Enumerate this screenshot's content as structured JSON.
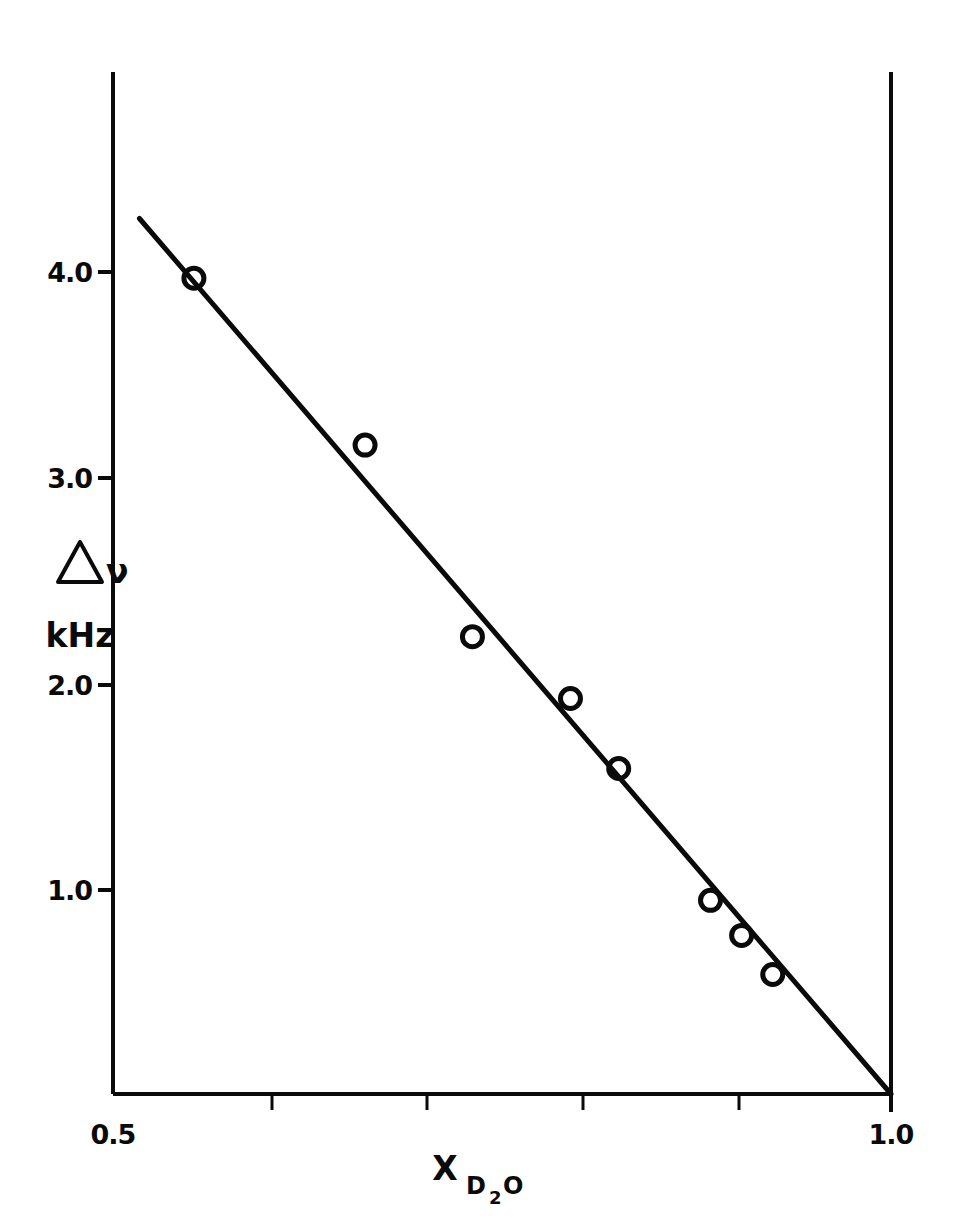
{
  "chart_data": {
    "type": "scatter",
    "title": "",
    "subtitle": "",
    "xlabel": "X",
    "xlabel_sub": "D",
    "xlabel_sub_num": "2",
    "xlabel_sub_tail": "O",
    "xlabel_full": "X_D2O",
    "ylabel_line1": "Δν",
    "ylabel_line2": "kHz",
    "ylabel_full": "Δν kHz",
    "xlim": [
      0.5,
      1.0
    ],
    "ylim": [
      0.0,
      4.3
    ],
    "grid": false,
    "legend": null,
    "x_major_ticks": [
      0.5,
      1.0
    ],
    "x_major_tick_labels": [
      "0.5",
      "1.0"
    ],
    "x_minor_ticks": [
      0.6,
      0.7,
      0.8,
      0.9
    ],
    "y_major_ticks": [
      1.0,
      2.0,
      3.0,
      4.0
    ],
    "y_major_tick_labels": [
      "1.0",
      "2.0",
      "3.0",
      "4.0"
    ],
    "marker": "open-circle",
    "marker_radius_px": 10,
    "points": [
      {
        "x": 0.552,
        "y": 3.96
      },
      {
        "x": 0.662,
        "y": 3.15
      },
      {
        "x": 0.731,
        "y": 2.22
      },
      {
        "x": 0.794,
        "y": 1.92
      },
      {
        "x": 0.825,
        "y": 1.58
      },
      {
        "x": 0.884,
        "y": 0.94
      },
      {
        "x": 0.904,
        "y": 0.77
      },
      {
        "x": 0.924,
        "y": 0.58
      }
    ],
    "series": [
      {
        "name": "data",
        "x": [
          0.552,
          0.662,
          0.731,
          0.794,
          0.825,
          0.884,
          0.904,
          0.924
        ],
        "values": [
          3.96,
          3.15,
          2.22,
          1.92,
          1.58,
          0.94,
          0.77,
          0.58
        ]
      }
    ],
    "fit_line": {
      "name": "linear-fit",
      "x_start": 0.517,
      "y_start": 4.25,
      "x_end": 1.0,
      "y_end": 0.0,
      "slope": -8.8,
      "intercept": 8.8
    },
    "colors": {
      "axis": "#0a0a0a",
      "line": "#0a0a0a",
      "marker": "#0a0a0a",
      "background": "#ffffff"
    }
  }
}
